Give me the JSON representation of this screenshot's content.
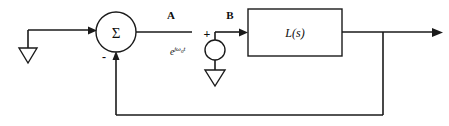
{
  "diagram": {
    "canvas": {
      "width": 449,
      "height": 126,
      "background": "#ffffff"
    },
    "line_color": "#1a1a1a",
    "blocks": [
      {
        "id": "plant",
        "label": "L(s)",
        "shape": "rectangle",
        "x": 248,
        "y": 9,
        "width": 94,
        "height": 47
      }
    ],
    "summing_junction": {
      "id": "summer",
      "symbol": "Σ",
      "shape": "circle",
      "cx": 116,
      "cy": 32,
      "r": 20,
      "input_sign_feedback": "-"
    },
    "source": {
      "id": "injection-source",
      "shape": "circle",
      "cx": 215,
      "cy": 50,
      "r": 10,
      "sign": "+",
      "label_e": "e",
      "label_j": "j",
      "label_omega": "ω",
      "label_subzero": "0",
      "label_t": "t",
      "label_full": "e^{jω₀t}"
    },
    "node_labels": [
      {
        "id": "node-a",
        "text": "A",
        "x": 171,
        "y": 18
      },
      {
        "id": "node-b",
        "text": "B",
        "x": 230,
        "y": 18
      }
    ],
    "grounds": [
      {
        "id": "ground-input",
        "x": 28,
        "y": 48
      },
      {
        "id": "ground-source",
        "x": 215,
        "y": 70
      }
    ],
    "signal_path": {
      "input_wire": "ground-input to summer",
      "forward_wire": "summer to L(s) via injection node B",
      "output_wire": "L(s) to output arrow",
      "feedback_wire": "output tap down, left, up into summer minus input"
    }
  }
}
